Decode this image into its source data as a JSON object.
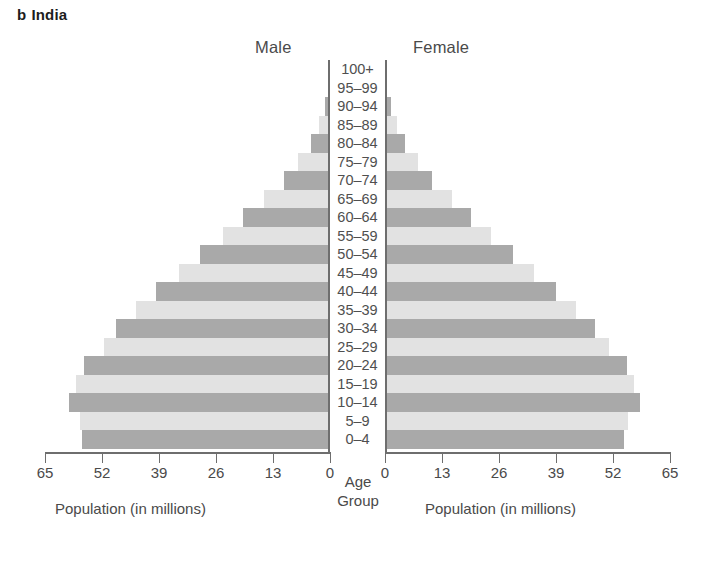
{
  "title": {
    "letter": "b",
    "name": "India"
  },
  "headers": {
    "male": "Male",
    "female": "Female"
  },
  "center_caption": {
    "line1": "Age",
    "line2": "Group"
  },
  "captions": {
    "left": "Population (in millions)",
    "right": "Population (in millions)"
  },
  "colors": {
    "bar_light": "#e2e2e2",
    "bar_dark": "#a9a9a9",
    "axis": "#6e6e6e",
    "text": "#4a4a4a"
  },
  "chart_data": {
    "type": "bar",
    "subtype": "population-pyramid",
    "xlabel": "Population (in millions)",
    "ylabel": "Age Group",
    "xlim": [
      0,
      65
    ],
    "xticks": [
      65,
      52,
      39,
      26,
      13,
      0
    ],
    "xticks_right": [
      0,
      13,
      26,
      39,
      52,
      65
    ],
    "grid": false,
    "legend": [
      "Male",
      "Female"
    ],
    "legend_position": "top",
    "categories": [
      "100+",
      "95–99",
      "90–94",
      "85–89",
      "80–84",
      "75–79",
      "70–74",
      "65–69",
      "60–64",
      "55–59",
      "50–54",
      "45–49",
      "40–44",
      "35–39",
      "30–34",
      "25–29",
      "20–24",
      "15–19",
      "10–14",
      "5–9",
      "0–4"
    ],
    "series": [
      {
        "name": "Male",
        "side": "left",
        "values": [
          0.1,
          0.4,
          1.1,
          2.4,
          4.3,
          7.2,
          10.6,
          15.0,
          19.8,
          24.5,
          29.6,
          34.4,
          39.6,
          44.2,
          48.7,
          51.5,
          56.0,
          58.0,
          59.5,
          57.0,
          56.5
        ]
      },
      {
        "name": "Female",
        "side": "right",
        "values": [
          0.1,
          0.5,
          1.3,
          2.7,
          4.6,
          7.5,
          10.8,
          15.2,
          19.6,
          24.2,
          29.2,
          34.0,
          39.0,
          43.6,
          48.0,
          51.0,
          55.2,
          56.8,
          58.2,
          55.5,
          54.5
        ]
      }
    ],
    "row_shading": [
      "dark",
      "light",
      "dark",
      "light",
      "dark",
      "light",
      "dark",
      "light",
      "dark",
      "light",
      "dark",
      "light",
      "dark",
      "light",
      "dark",
      "light",
      "dark",
      "light",
      "dark",
      "light",
      "dark"
    ]
  },
  "geometry": {
    "left_axis_x": 330,
    "right_axis_x": 385,
    "px_per_unit": 4.385,
    "row_height": 18.5,
    "plot_top": 60
  }
}
